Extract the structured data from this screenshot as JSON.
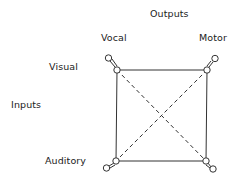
{
  "diagram": {
    "axes": {
      "outputs_label": "Outputs",
      "inputs_label": "Inputs"
    },
    "outputs": [
      {
        "id": "vocal",
        "label": "Vocal"
      },
      {
        "id": "motor",
        "label": "Motor"
      }
    ],
    "inputs": [
      {
        "id": "visual",
        "label": "Visual"
      },
      {
        "id": "auditory",
        "label": "Auditory"
      }
    ],
    "nodes": [
      {
        "id": "visual-vocal",
        "x": 117,
        "y": 70,
        "handle": [
          108,
          58
        ]
      },
      {
        "id": "visual-motor",
        "x": 207,
        "y": 70,
        "handle": [
          215,
          59
        ]
      },
      {
        "id": "auditory-vocal",
        "x": 116,
        "y": 161,
        "handle": [
          107,
          168
        ]
      },
      {
        "id": "auditory-motor",
        "x": 206,
        "y": 161,
        "handle": [
          213,
          169
        ]
      }
    ],
    "edges": {
      "solid": [
        [
          "visual-vocal",
          "visual-motor"
        ],
        [
          "auditory-vocal",
          "auditory-motor"
        ],
        [
          "visual-vocal",
          "auditory-vocal"
        ],
        [
          "visual-motor",
          "auditory-motor"
        ]
      ],
      "dashed": [
        [
          "visual-vocal",
          "auditory-motor"
        ],
        [
          "visual-motor",
          "auditory-vocal"
        ]
      ]
    },
    "colors": {
      "line": "#333333",
      "background": "#ffffff"
    }
  }
}
